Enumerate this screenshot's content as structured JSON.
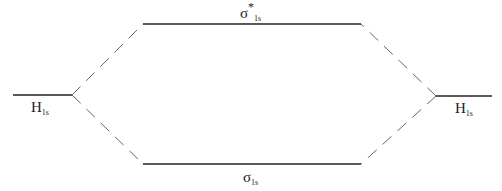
{
  "diagram": {
    "type": "molecular-orbital-diagram",
    "levels": {
      "left_atomic": {
        "symbol": "H",
        "subscript": "1s"
      },
      "right_atomic": {
        "symbol": "H",
        "subscript": "1s"
      },
      "antibonding": {
        "symbol": "σ",
        "superscript": "*",
        "subscript": "1s"
      },
      "bonding": {
        "symbol": "σ",
        "subscript": "1s"
      }
    },
    "colors": {
      "line": "#222222",
      "dash": "#555555"
    }
  }
}
